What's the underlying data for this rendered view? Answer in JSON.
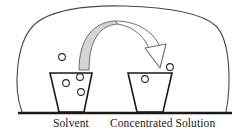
{
  "figure": {
    "background_color": "#ffffff",
    "ink_color": "#1a1a1a",
    "arrow_fill_color": "#d6d6d6",
    "arrow_outline_color": "#6b6b6b",
    "particle_outline_color": "#2b2b2b"
  },
  "labels": {
    "left": "Solvent",
    "right": "Concentrated Solution"
  },
  "enclosure": {
    "name": "outer-boundary",
    "shape": "rounded-blob",
    "stroke_width": 1
  },
  "baseline": {
    "name": "ground-line",
    "stroke_width": 2,
    "x_start": 18,
    "x_end": 232,
    "y": 113
  },
  "beakers": [
    {
      "id": "left-beaker",
      "label": "Solvent",
      "top_left_x": 50,
      "top_right_x": 92,
      "bottom_left_x": 59,
      "bottom_right_x": 84,
      "top_y": 73,
      "bottom_y": 112,
      "particles_inside": 3,
      "particles_outside": 1
    },
    {
      "id": "right-beaker",
      "label": "Concentrated Solution",
      "top_left_x": 128,
      "top_right_x": 172,
      "bottom_left_x": 137,
      "bottom_right_x": 163,
      "top_y": 73,
      "bottom_y": 112,
      "particles_inside": 1,
      "particles_outside": 1
    }
  ],
  "particles": [
    {
      "id": "p1",
      "cx": 62,
      "cy": 57,
      "r": 3.4,
      "group": "left-outside"
    },
    {
      "id": "p2",
      "cx": 66,
      "cy": 83,
      "r": 3.4,
      "group": "left-inside"
    },
    {
      "id": "p3",
      "cx": 80,
      "cy": 77,
      "r": 3.4,
      "group": "left-inside"
    },
    {
      "id": "p4",
      "cx": 81,
      "cy": 92,
      "r": 3.4,
      "group": "left-inside"
    },
    {
      "id": "p5",
      "cx": 170,
      "cy": 67,
      "r": 3.4,
      "group": "right-outside"
    },
    {
      "id": "p6",
      "cx": 145,
      "cy": 79,
      "r": 3.4,
      "group": "right-inside"
    }
  ],
  "arrow": {
    "name": "transfer-arrow",
    "from": "Solvent",
    "to": "Concentrated Solution",
    "direction": "left-to-right",
    "apex_x": 115,
    "apex_y": 21,
    "tail_x": 80,
    "tail_y": 70,
    "head_tip_x": 163,
    "head_tip_y": 62
  }
}
